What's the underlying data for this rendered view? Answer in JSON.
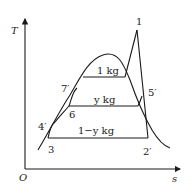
{
  "diagram": {
    "type": "T-s diagram (regenerative Rankine cycle)",
    "axes": {
      "y_label": "T",
      "x_label": "s",
      "origin_label": "O"
    },
    "points": {
      "p1": "1",
      "p2": "2′",
      "p3": "3",
      "p4": "4′",
      "p5": "5′",
      "p6": "6",
      "p7": "7′"
    },
    "mass_labels": {
      "top": "1 kg",
      "middle": "y kg",
      "bottom": "1−y kg"
    },
    "colors": {
      "line": "#1a1a1a",
      "background": "#ffffff"
    }
  }
}
